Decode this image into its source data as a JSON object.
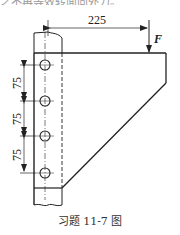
{
  "top_text": "之不再等效转面向外力。",
  "caption": "习题 11-7 图",
  "dimensions": {
    "horizontal": "225",
    "vertical": [
      "75",
      "75",
      "75"
    ]
  },
  "force_label": "F",
  "holes": [
    {
      "cx": 45,
      "cy": 65
    },
    {
      "cx": 45,
      "cy": 101
    },
    {
      "cx": 45,
      "cy": 136
    },
    {
      "cx": 45,
      "cy": 173
    }
  ],
  "colors": {
    "line": "#222222",
    "caption": "#333333"
  }
}
